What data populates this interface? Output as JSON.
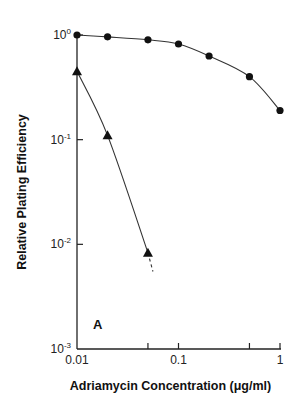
{
  "chart_data": {
    "type": "line",
    "title": "",
    "panel_label": "A",
    "xlabel": "Adriamycin Concentration (μg/ml)",
    "ylabel": "Relative Plating Efficiency",
    "xscale": "log",
    "yscale": "log",
    "xlim": [
      0.01,
      1
    ],
    "ylim": [
      0.001,
      1
    ],
    "x_ticks": [
      {
        "value": 0.01,
        "label": "0.01"
      },
      {
        "value": 0.05,
        "label": ""
      },
      {
        "value": 0.1,
        "label": "0.1"
      },
      {
        "value": 0.5,
        "label": ""
      },
      {
        "value": 1,
        "label": "1"
      }
    ],
    "y_ticks": [
      {
        "value": 1,
        "base": "10",
        "exp": "0"
      },
      {
        "value": 0.1,
        "base": "10",
        "exp": "-1"
      },
      {
        "value": 0.01,
        "base": "10",
        "exp": "-2"
      },
      {
        "value": 0.001,
        "base": "10",
        "exp": "-3"
      }
    ],
    "grid": false,
    "legend": null,
    "series": [
      {
        "name": "circles",
        "marker": "circle",
        "x": [
          0.01,
          0.02,
          0.05,
          0.1,
          0.2,
          0.5,
          1.0
        ],
        "y": [
          1.0,
          0.96,
          0.9,
          0.82,
          0.63,
          0.4,
          0.19
        ]
      },
      {
        "name": "triangles",
        "marker": "triangle",
        "x": [
          0.01,
          0.02,
          0.05
        ],
        "y": [
          0.45,
          0.11,
          0.0083
        ],
        "dashed_extension": {
          "x": [
            0.05,
            0.056
          ],
          "y": [
            0.0083,
            0.0055
          ]
        }
      }
    ]
  }
}
